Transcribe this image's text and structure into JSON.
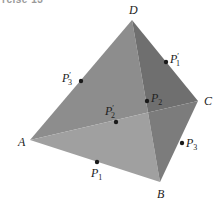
{
  "caption": "rcise 13",
  "diagram": {
    "type": "tetrahedron",
    "vertices": [
      {
        "name": "A",
        "x": 30,
        "y": 140,
        "label_x": 18,
        "label_y": 146
      },
      {
        "name": "B",
        "x": 160,
        "y": 182,
        "label_x": 157,
        "label_y": 198
      },
      {
        "name": "C",
        "x": 198,
        "y": 101,
        "label_x": 204,
        "label_y": 105
      },
      {
        "name": "D",
        "x": 132,
        "y": 20,
        "label_x": 129,
        "label_y": 14
      }
    ],
    "points": [
      {
        "name": "P1",
        "base": "P",
        "sub": "1",
        "prime": "",
        "x": 97,
        "y": 162,
        "label_x": 91,
        "label_y": 177
      },
      {
        "name": "P1'",
        "base": "P",
        "sub": "1",
        "prime": "′",
        "x": 166,
        "y": 62,
        "label_x": 170,
        "label_y": 63
      },
      {
        "name": "P2",
        "base": "P",
        "sub": "2",
        "prime": "",
        "x": 147,
        "y": 101,
        "label_x": 151,
        "label_y": 102
      },
      {
        "name": "P2'",
        "base": "P",
        "sub": "2",
        "prime": "′",
        "x": 116,
        "y": 122,
        "label_x": 105,
        "label_y": 115
      },
      {
        "name": "P3",
        "base": "P",
        "sub": "3",
        "prime": "",
        "x": 182,
        "y": 143,
        "label_x": 186,
        "label_y": 147
      },
      {
        "name": "P3'",
        "base": "P",
        "sub": "3",
        "prime": "′",
        "x": 81,
        "y": 81,
        "label_x": 62,
        "label_y": 82
      }
    ],
    "colors": {
      "face_left_upper": "#8d8d8d",
      "face_right_upper": "#6f6f6f",
      "face_left_lower": "#a0a0a0",
      "face_right_lower": "#7c7c7c",
      "point": "#1a1a1a"
    }
  }
}
